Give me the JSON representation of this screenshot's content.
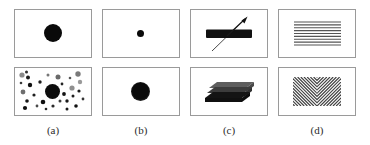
{
  "figure": {
    "title": "",
    "background_color": "#ffffff",
    "panel_border_color": "#9a9a9a",
    "label_color": "#2b2b2b",
    "columns": [
      {
        "id": "a",
        "label": "(a)",
        "top_panel": {
          "name": "single-large-dot",
          "description": "one large black disk centered",
          "elements": [
            {
              "shape": "circle",
              "cx": 38,
              "cy": 23,
              "r": 9,
              "color": "#0a0a0a"
            }
          ]
        },
        "bottom_panel": {
          "name": "dot-field-with-central-large-dot",
          "description": "large black disk surrounded by many small dots of varying size and gray level",
          "elements": [
            {
              "shape": "circle",
              "cx": 37.5,
              "cy": 23.5,
              "r": 7.5,
              "color": "#0d0d0d"
            },
            {
              "shape": "circle",
              "cx": 7,
              "cy": 7,
              "r": 2.6,
              "color": "#8a8a8a"
            },
            {
              "shape": "circle",
              "cx": 11.5,
              "cy": 4,
              "r": 1.5,
              "color": "#2e2e2e"
            },
            {
              "shape": "circle",
              "cx": 13,
              "cy": 9.5,
              "r": 2.0,
              "color": "#1a1a1a"
            },
            {
              "shape": "circle",
              "cx": 6,
              "cy": 15,
              "r": 1.3,
              "color": "#3a3a3a"
            },
            {
              "shape": "circle",
              "cx": 15,
              "cy": 17,
              "r": 2.2,
              "color": "#111111"
            },
            {
              "shape": "circle",
              "cx": 8,
              "cy": 24,
              "r": 2.4,
              "color": "#6e6e6e"
            },
            {
              "shape": "circle",
              "cx": 19,
              "cy": 27,
              "r": 1.6,
              "color": "#202020"
            },
            {
              "shape": "circle",
              "cx": 12,
              "cy": 33,
              "r": 1.8,
              "color": "#141414"
            },
            {
              "shape": "circle",
              "cx": 10,
              "cy": 40,
              "r": 2.1,
              "color": "#101010"
            },
            {
              "shape": "circle",
              "cx": 22,
              "cy": 38,
              "r": 1.4,
              "color": "#4a4a4a"
            },
            {
              "shape": "circle",
              "cx": 25,
              "cy": 14,
              "r": 1.7,
              "color": "#1d1d1d"
            },
            {
              "shape": "circle",
              "cx": 28,
              "cy": 34,
              "r": 2.3,
              "color": "#0f0f0f"
            },
            {
              "shape": "circle",
              "cx": 33,
              "cy": 7,
              "r": 1.5,
              "color": "#777777"
            },
            {
              "shape": "circle",
              "cx": 38,
              "cy": 38,
              "r": 1.6,
              "color": "#2a2a2a"
            },
            {
              "shape": "circle",
              "cx": 43,
              "cy": 9,
              "r": 2.5,
              "color": "#6a6a6a"
            },
            {
              "shape": "circle",
              "cx": 47,
              "cy": 16,
              "r": 1.4,
              "color": "#242424"
            },
            {
              "shape": "circle",
              "cx": 49,
              "cy": 26,
              "r": 1.9,
              "color": "#131313"
            },
            {
              "shape": "circle",
              "cx": 45,
              "cy": 33,
              "r": 1.5,
              "color": "#3d3d3d"
            },
            {
              "shape": "circle",
              "cx": 52,
              "cy": 33,
              "r": 1.7,
              "color": "#171717"
            },
            {
              "shape": "circle",
              "cx": 55,
              "cy": 10,
              "r": 1.3,
              "color": "#555555"
            },
            {
              "shape": "circle",
              "cx": 57,
              "cy": 20,
              "r": 2.6,
              "color": "#8f8f8f"
            },
            {
              "shape": "circle",
              "cx": 58,
              "cy": 28,
              "r": 1.5,
              "color": "#1f1f1f"
            },
            {
              "shape": "circle",
              "cx": 63,
              "cy": 6,
              "r": 2.7,
              "color": "#7a7a7a"
            },
            {
              "shape": "circle",
              "cx": 65,
              "cy": 14,
              "r": 2.2,
              "color": "#9a9a9a"
            },
            {
              "shape": "circle",
              "cx": 64,
              "cy": 23,
              "r": 1.6,
              "color": "#1c1c1c"
            },
            {
              "shape": "circle",
              "cx": 61,
              "cy": 38,
              "r": 1.8,
              "color": "#121212"
            },
            {
              "shape": "circle",
              "cx": 68,
              "cy": 31,
              "r": 1.4,
              "color": "#343434"
            },
            {
              "shape": "circle",
              "cx": 31,
              "cy": 41,
              "r": 1.3,
              "color": "#282828"
            },
            {
              "shape": "circle",
              "cx": 52,
              "cy": 41,
              "r": 1.5,
              "color": "#1a1a1a"
            }
          ]
        }
      },
      {
        "id": "b",
        "label": "(b)",
        "top_panel": {
          "name": "small-sharp-dot",
          "description": "one small black disk with sharp edge, centered",
          "elements": [
            {
              "shape": "circle",
              "cx": 37.5,
              "cy": 23.5,
              "r": 3.5,
              "color": "#0a0a0a"
            }
          ]
        },
        "bottom_panel": {
          "name": "large-blurred-dot",
          "description": "one large black disk with soft blurred edge, centered",
          "elements": [
            {
              "shape": "circle-blurred",
              "cx": 37.5,
              "cy": 23.5,
              "r": 9.5,
              "color": "#0a0a0a"
            }
          ]
        }
      },
      {
        "id": "c",
        "label": "(c)",
        "top_panel": {
          "name": "bar-with-diagonal-arrow",
          "description": "horizontal black bar crossed by a thin diagonal arrow pointing up-right",
          "elements": [
            {
              "shape": "bar",
              "x": 15,
              "y": 20,
              "width": 46,
              "height": 8,
              "color": "#111111"
            },
            {
              "shape": "arrow",
              "x1": 22,
              "y1": 40,
              "x2": 55,
              "y2": 8,
              "color": "#3a3a3a"
            }
          ]
        },
        "bottom_panel": {
          "name": "stacked-slabs-3d",
          "description": "sheared stack of slabs: light gray top face, dark gray mid face, black bottom face",
          "elements": [
            {
              "shape": "slab",
              "face": "top",
              "color": "#5e5e5e"
            },
            {
              "shape": "slab",
              "face": "middle",
              "color": "#3a3a3a"
            },
            {
              "shape": "slab",
              "face": "bottom",
              "color": "#121212"
            }
          ]
        }
      },
      {
        "id": "d",
        "label": "(d)",
        "top_panel": {
          "name": "horizontal-line-texture",
          "description": "rectangular block filled with evenly spaced horizontal gray lines",
          "line_count": 9,
          "line_color": "#555555",
          "line_spacing_px": 3
        },
        "bottom_panel": {
          "name": "chevron-line-texture",
          "description": "rectangular block filled with diagonal lines forming chevron / V pattern meeting at center",
          "line_count": 20,
          "line_color": "#3f3f3f",
          "line_spacing_px": 3.2
        }
      }
    ]
  }
}
